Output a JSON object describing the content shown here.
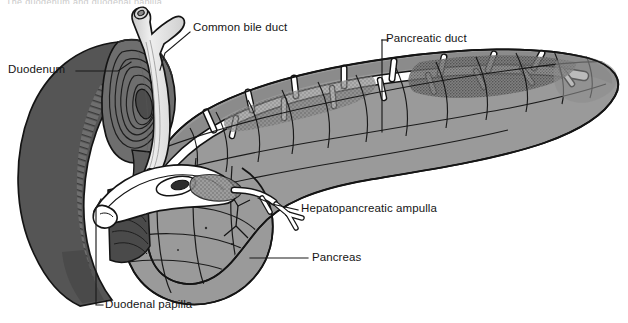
{
  "figure": {
    "title": "The duodenum and duodenal papilla",
    "background_color": "#ffffff",
    "width": 628,
    "height": 323
  },
  "colors": {
    "ink": "#151515",
    "duodenum_outer": "#555555",
    "duodenum_mid": "#6e6e6e",
    "duodenum_lumen": "#7a7a7a",
    "pancreas_body": "#9a9a9a",
    "pancreas_shadow": "#8a8a8a",
    "duct_white": "#ffffff",
    "bile_duct": "#e2e2e2",
    "stipple": "#6a6a6a",
    "leader": "#1a1a1a"
  },
  "labels": [
    {
      "id": "duodenum",
      "text": "Duodenum",
      "x": 8,
      "y": 64,
      "leader": "M 76,71 L 118,71 L 131,62"
    },
    {
      "id": "common-bile-duct",
      "text": "Common bile duct",
      "x": 193,
      "y": 22,
      "leader": "M 190,32 L 165,53 L 160,70"
    },
    {
      "id": "pancreatic-duct",
      "text": "Pancreatic duct",
      "x": 386,
      "y": 33,
      "leader": "M 382,40 L 382,132"
    },
    {
      "id": "hepatopancreatic-ampulla",
      "text": "Hepatopancreatic ampulla",
      "x": 301,
      "y": 203,
      "leader": "M 298,210 L 275,205 L 262,199"
    },
    {
      "id": "pancreas",
      "text": "Pancreas",
      "x": 312,
      "y": 252,
      "leader": "M 308,258 L 255,258"
    },
    {
      "id": "duodenal-papilla",
      "text": "Duodenal papilla",
      "x": 105,
      "y": 299,
      "leader": "M 103,305 L 96,305 L 96,205 L 101,197"
    }
  ],
  "structures": [
    {
      "id": "duodenum",
      "name": "Duodenum (cut open, showing plicae circulares)"
    },
    {
      "id": "common-bile-duct",
      "name": "Common bile duct"
    },
    {
      "id": "pancreatic-duct",
      "name": "Pancreatic duct (duct of Wirsung) with side branches"
    },
    {
      "id": "hepatopancreatic-ampulla",
      "name": "Hepatopancreatic ampulla (ampulla of Vater)"
    },
    {
      "id": "pancreas-head",
      "name": "Head of pancreas"
    },
    {
      "id": "pancreas-body",
      "name": "Body of pancreas"
    },
    {
      "id": "pancreas-tail",
      "name": "Tail of pancreas"
    },
    {
      "id": "duodenal-papilla",
      "name": "Duodenal papilla"
    }
  ]
}
